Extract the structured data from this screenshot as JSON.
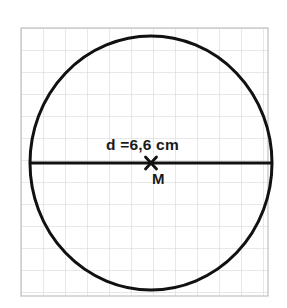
{
  "figure": {
    "type": "geometry-diagram",
    "background_color": "#ffffff",
    "grid": {
      "visible": true,
      "line_color": "#cfcfcf",
      "border_color": "#bcbcbc",
      "cell_size_px": 22,
      "origin_x_px": 21,
      "origin_y_px": 28,
      "columns": 11,
      "rows": 12
    },
    "circle": {
      "stroke_color": "#111111",
      "stroke_width_px": 3,
      "fill": "none",
      "center_x_px": 151,
      "center_y_px": 163,
      "radius_x_px": 121,
      "radius_y_px": 127
    },
    "diameter_line": {
      "stroke_color": "#111111",
      "stroke_width_px": 3,
      "x1_px": 30,
      "y1_px": 163,
      "x2_px": 272,
      "y2_px": 163
    },
    "center_mark": {
      "glyph": "x-cross",
      "stroke_color": "#111111",
      "stroke_width_px": 2.6,
      "x_px": 151,
      "y_px": 163,
      "arm_px": 6
    },
    "labels": {
      "diameter": "d =6,6 cm",
      "center": "M"
    },
    "measurements": {
      "diameter_value": "6,6",
      "diameter_unit": "cm",
      "diameter_symbol": "d",
      "center_symbol": "M"
    }
  }
}
